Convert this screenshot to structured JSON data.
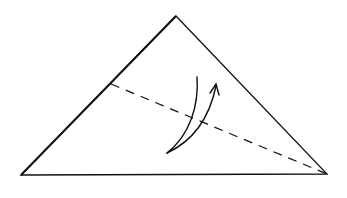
{
  "diagram": {
    "type": "origami-fold-step",
    "background": "#ffffff",
    "stroke_color": "#111111",
    "shape": {
      "name": "triangle",
      "apex": [
        176,
        16
      ],
      "left_base": [
        21,
        175
      ],
      "right_base": [
        327,
        174
      ]
    },
    "fold_line": {
      "style": "dashed",
      "from": [
        111,
        84
      ],
      "to": [
        327,
        174
      ]
    },
    "fold_arrow": {
      "direction": "up",
      "tail_top": [
        197,
        77
      ],
      "pivot": [
        167,
        153
      ],
      "head": [
        216,
        84
      ]
    }
  }
}
